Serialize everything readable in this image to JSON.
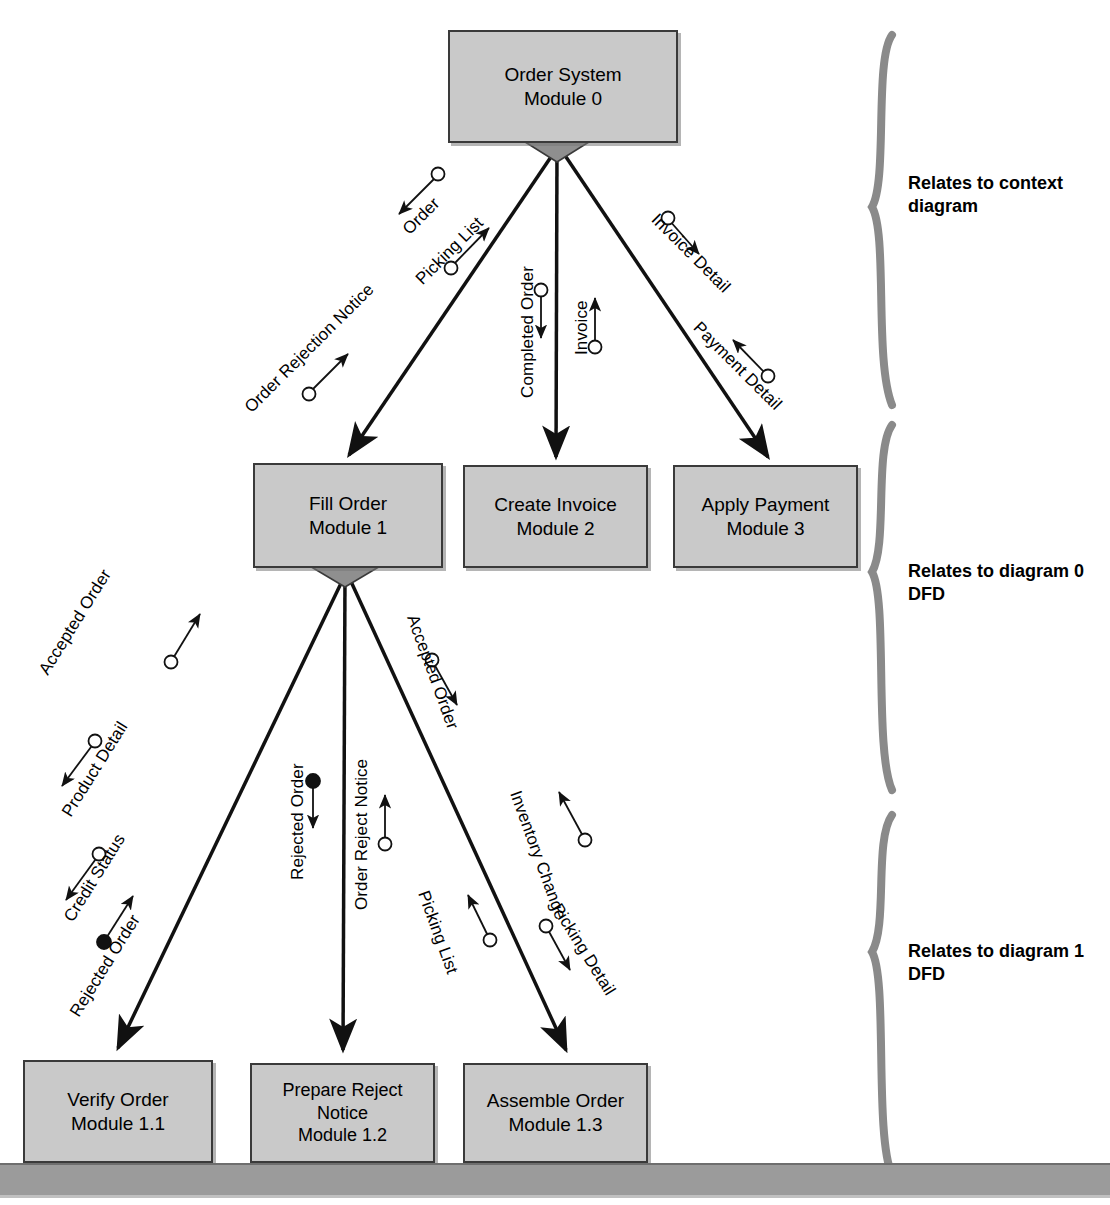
{
  "diagram": {
    "type": "structure-chart",
    "colors": {
      "module_fill": "#c9c9c9",
      "module_border": "#3a3a3a",
      "line": "#111111",
      "brace": "#8a8a8a",
      "bottom_bar": "#9b9b9b",
      "diamond_fill": "#8f8f8f"
    }
  },
  "modules": [
    {
      "id": "m0",
      "name": "Order System",
      "number": "Module 0",
      "x": 448,
      "y": 30,
      "w": 230,
      "h": 113,
      "level": 0
    },
    {
      "id": "m1",
      "name": "Fill Order",
      "number": "Module 1",
      "x": 253,
      "y": 463,
      "w": 190,
      "h": 105,
      "level": 1
    },
    {
      "id": "m2",
      "name": "Create Invoice",
      "number": "Module 2",
      "x": 463,
      "y": 465,
      "w": 185,
      "h": 103,
      "level": 1
    },
    {
      "id": "m3",
      "name": "Apply Payment",
      "number": "Module 3",
      "x": 673,
      "y": 465,
      "w": 185,
      "h": 103,
      "level": 1
    },
    {
      "id": "m11",
      "name": "Verify Order",
      "number": "Module 1.1",
      "x": 23,
      "y": 1060,
      "w": 190,
      "h": 103,
      "level": 2
    },
    {
      "id": "m12",
      "name": "Prepare Reject Notice",
      "number": "Module 1.2",
      "x": 250,
      "y": 1063,
      "w": 185,
      "h": 100,
      "level": 2
    },
    {
      "id": "m13",
      "name": "Assemble Order",
      "number": "Module 1.3",
      "x": 463,
      "y": 1063,
      "w": 185,
      "h": 100,
      "level": 2
    }
  ],
  "couples": [
    {
      "label": "Order",
      "kind": "data",
      "direction": "down",
      "from": "m1",
      "to": "m0"
    },
    {
      "label": "Picking List",
      "kind": "data",
      "direction": "up",
      "from": "m1",
      "to": "m0"
    },
    {
      "label": "Order Rejection Notice",
      "kind": "data",
      "direction": "up",
      "from": "m1",
      "to": "m0"
    },
    {
      "label": "Completed Order",
      "kind": "data",
      "direction": "down",
      "from": "m0",
      "to": "m2"
    },
    {
      "label": "Invoice",
      "kind": "data",
      "direction": "up",
      "from": "m2",
      "to": "m0"
    },
    {
      "label": "Invoice Detail",
      "kind": "data",
      "direction": "down",
      "from": "m0",
      "to": "m3"
    },
    {
      "label": "Payment Detail",
      "kind": "data",
      "direction": "up",
      "from": "m3",
      "to": "m0"
    },
    {
      "label": "Accepted Order",
      "kind": "data",
      "direction": "up",
      "from": "m11",
      "to": "m1"
    },
    {
      "label": "Product Detail",
      "kind": "data",
      "direction": "down",
      "from": "m1",
      "to": "m11"
    },
    {
      "label": "Credit Status",
      "kind": "data",
      "direction": "down",
      "from": "m1",
      "to": "m11"
    },
    {
      "label": "Rejected Order",
      "kind": "control",
      "direction": "up",
      "from": "m11",
      "to": "m1"
    },
    {
      "label": "Rejected Order",
      "kind": "control",
      "direction": "down",
      "from": "m1",
      "to": "m12"
    },
    {
      "label": "Order Reject Notice",
      "kind": "data",
      "direction": "up",
      "from": "m12",
      "to": "m1"
    },
    {
      "label": "Accepted Order",
      "kind": "data",
      "direction": "down",
      "from": "m1",
      "to": "m13"
    },
    {
      "label": "Inventory Change",
      "kind": "data",
      "direction": "up",
      "from": "m13",
      "to": "m1"
    },
    {
      "label": "Picking List",
      "kind": "data",
      "direction": "up",
      "from": "m13",
      "to": "m1"
    },
    {
      "label": "Picking Detail",
      "kind": "data",
      "direction": "down",
      "from": "m1",
      "to": "m13"
    }
  ],
  "braces": [
    {
      "id": "brace-context",
      "text": "Relates to context diagram",
      "top": 35,
      "bottom": 405,
      "label_y": 172
    },
    {
      "id": "brace-diagram0",
      "text": "Relates to diagram 0 DFD",
      "top": 425,
      "bottom": 790,
      "label_y": 560
    },
    {
      "id": "brace-diagram1",
      "text": "Relates to diagram 1 DFD",
      "top": 815,
      "bottom": 1175,
      "label_y": 940
    }
  ],
  "bottom_bar": {
    "y": 1163,
    "height": 30
  }
}
